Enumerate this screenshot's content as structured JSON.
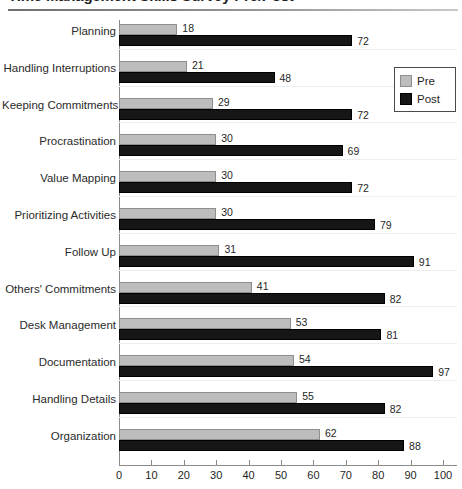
{
  "title": {
    "text": "Time Management Skills Survey Pre/Post",
    "clipped": true
  },
  "legend": {
    "position": "top-right",
    "entries": [
      {
        "label": "Pre",
        "color": "#bdbdbd"
      },
      {
        "label": "Post",
        "color": "#161616"
      }
    ]
  },
  "axis": {
    "x_ticks": [
      "0",
      "10",
      "20",
      "30",
      "40",
      "50",
      "60",
      "70",
      "80",
      "90",
      "100"
    ]
  },
  "chart_data": {
    "type": "bar",
    "orientation": "horizontal",
    "title": "Time Management Skills Survey Pre/Post",
    "xlabel": "",
    "ylabel": "",
    "xlim": [
      0,
      100
    ],
    "xticks": [
      0,
      10,
      20,
      30,
      40,
      50,
      60,
      70,
      80,
      90,
      100
    ],
    "grid": false,
    "legend_position": "top-right",
    "categories": [
      "Planning",
      "Handling Interruptions",
      "Keeping Commitments",
      "Procrastination",
      "Value Mapping",
      "Prioritizing Activities",
      "Follow Up",
      "Others' Commitments",
      "Desk Management",
      "Documentation",
      "Handling Details",
      "Organization"
    ],
    "series": [
      {
        "name": "Pre",
        "color": "#bdbdbd",
        "values": [
          18,
          21,
          29,
          30,
          30,
          30,
          31,
          41,
          53,
          54,
          55,
          62
        ]
      },
      {
        "name": "Post",
        "color": "#161616",
        "values": [
          72,
          48,
          72,
          69,
          72,
          79,
          91,
          82,
          81,
          97,
          82,
          88
        ]
      }
    ]
  }
}
